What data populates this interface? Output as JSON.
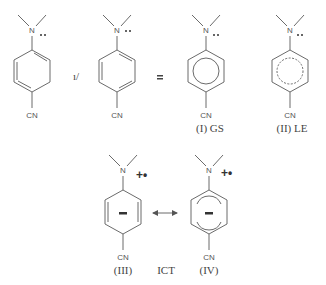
{
  "figure": {
    "atom_labels": {
      "nitrogen": "N",
      "nitrile": "CN"
    },
    "top_row": {
      "separator": "↔",
      "equals": "=",
      "molecules": [
        {
          "id": "kekule-1",
          "label": ""
        },
        {
          "id": "kekule-2",
          "label": ""
        },
        {
          "id": "gs",
          "label": "(I) GS"
        },
        {
          "id": "le",
          "label": "(II) LE"
        }
      ]
    },
    "bottom_row": {
      "charge_plus": "+•",
      "charge_minus": "-",
      "center_label": "ICT",
      "molecules": [
        {
          "id": "ict-3",
          "label": "(III)"
        },
        {
          "id": "ict-4",
          "label": "(IV)"
        }
      ]
    },
    "colors": {
      "bond": "#6b6b6b",
      "text": "#444444"
    }
  }
}
